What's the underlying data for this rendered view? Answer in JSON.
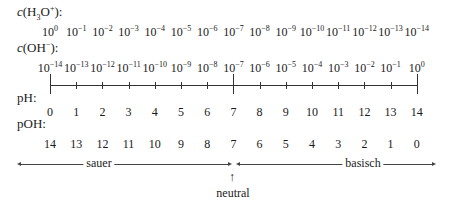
{
  "labels": {
    "h3o_prefix": "c",
    "h3o_formula": "(H",
    "h3o_sub": "3",
    "h3o_o": "O",
    "h3o_sup": "+",
    "h3o_close": "):",
    "oh_prefix": "c",
    "oh_formula": "(OH",
    "oh_sup": "−",
    "oh_close": "):",
    "ph": "pH:",
    "poh": "pOH:",
    "sauer": "sauer",
    "basisch": "basisch",
    "neutral": "neutral",
    "neutral_arrow": "↑"
  },
  "h3o_exponents": [
    "0",
    "−1",
    "−2",
    "−3",
    "−4",
    "−5",
    "−6",
    "−7",
    "−8",
    "−9",
    "−10",
    "−11",
    "−12",
    "−13",
    "−14"
  ],
  "oh_exponents": [
    "−14",
    "−13",
    "−12",
    "−11",
    "−10",
    "−9",
    "−8",
    "−7",
    "−6",
    "−5",
    "−4",
    "−3",
    "−2",
    "−1",
    "0"
  ],
  "ph_values": [
    "0",
    "1",
    "2",
    "3",
    "4",
    "5",
    "6",
    "7",
    "8",
    "9",
    "10",
    "11",
    "12",
    "13",
    "14"
  ],
  "poh_values": [
    "14",
    "13",
    "12",
    "11",
    "10",
    "9",
    "8",
    "7",
    "6",
    "5",
    "4",
    "3",
    "2",
    "1",
    "0"
  ],
  "base": "10",
  "chart_data": {
    "type": "table",
    "rows": [
      {
        "name": "c(H3O+)",
        "values": [
          "10^0",
          "10^-1",
          "10^-2",
          "10^-3",
          "10^-4",
          "10^-5",
          "10^-6",
          "10^-7",
          "10^-8",
          "10^-9",
          "10^-10",
          "10^-11",
          "10^-12",
          "10^-13",
          "10^-14"
        ]
      },
      {
        "name": "c(OH-)",
        "values": [
          "10^-14",
          "10^-13",
          "10^-12",
          "10^-11",
          "10^-10",
          "10^-9",
          "10^-8",
          "10^-7",
          "10^-6",
          "10^-5",
          "10^-4",
          "10^-3",
          "10^-2",
          "10^-1",
          "10^0"
        ]
      },
      {
        "name": "pH",
        "values": [
          0,
          1,
          2,
          3,
          4,
          5,
          6,
          7,
          8,
          9,
          10,
          11,
          12,
          13,
          14
        ]
      },
      {
        "name": "pOH",
        "values": [
          14,
          13,
          12,
          11,
          10,
          9,
          8,
          7,
          6,
          5,
          4,
          3,
          2,
          1,
          0
        ]
      }
    ],
    "regions": [
      {
        "label": "sauer",
        "from_ph": 0,
        "to_ph": 7
      },
      {
        "label": "neutral",
        "at_ph": 7
      },
      {
        "label": "basisch",
        "from_ph": 7,
        "to_ph": 14
      }
    ]
  }
}
